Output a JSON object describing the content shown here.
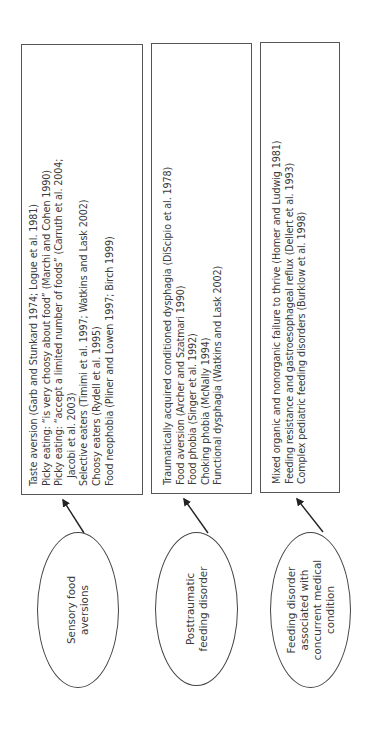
{
  "diagram": {
    "orientation": "rotated 90 degrees counter-clockwise",
    "categories": [
      {
        "label_lines": [
          "Sensory food",
          "aversions"
        ],
        "examples": [
          {
            "text": "Taste aversion (Garb and Stunkard 1974; Logue et al. 1981)",
            "indent": false
          },
          {
            "text": "Picky eating: “is very choosy about food” (Marchi and Cohen 1990)",
            "indent": false
          },
          {
            "text": "Picky eating: “accept a limited number of foods” (Carruth et al. 2004;",
            "indent": false
          },
          {
            "text": "Jacobi et al. 2003)",
            "indent": true
          },
          {
            "text": "Selective eaters (Timimi et al. 1997; Watkins and Lask 2002)",
            "indent": false
          },
          {
            "text": "Choosy eaters (Rydell et al. 1995)",
            "indent": false
          },
          {
            "text": "Food neophobia (Pliner and Lowen 1997; Birch 1999)",
            "indent": false
          }
        ]
      },
      {
        "label_lines": [
          "Posttraumatic",
          "feeding disorder"
        ],
        "examples": [
          {
            "text": "Traumatically acquired conditioned dysphagia (DiScipio et al. 1978)",
            "indent": false
          },
          {
            "text": "Food aversion (Archer and Szatmari 1990)",
            "indent": false
          },
          {
            "text": "Food phobia (Singer et al. 1992)",
            "indent": false
          },
          {
            "text": "Choking phobia (McNally 1994)",
            "indent": false
          },
          {
            "text": "Functional dysphagia (Watkins and Lask 2002)",
            "indent": false
          }
        ]
      },
      {
        "label_lines": [
          "Feeding disorder",
          "associated with",
          "concurrent medical",
          "condition"
        ],
        "examples": [
          {
            "text": "Mixed organic and nonorganic failure to thrive (Homer and Ludwig 1981)",
            "indent": false
          },
          {
            "text": "Feeding resistance and gastroesophageal reflux (Dellert et al. 1993)",
            "indent": false
          },
          {
            "text": "Complex pediatric feeding disorders (Burklow et al. 1998)",
            "indent": false
          }
        ]
      }
    ]
  },
  "colors": {
    "stroke": "#444444",
    "text": "#3a3a3a",
    "background": "#ffffff"
  }
}
